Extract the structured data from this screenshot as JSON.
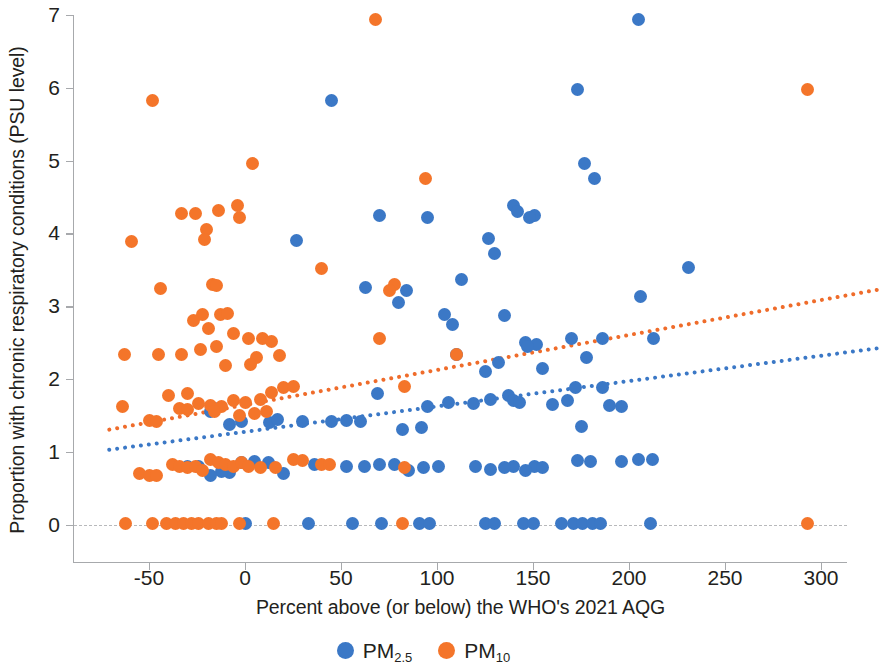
{
  "chart_data": {
    "type": "scatter",
    "title": "",
    "xlabel": "Percent above (or below) the WHO's 2021 AQG",
    "ylabel": "Proportion with chronic respiratory conditions (PSU level)",
    "xlim": [
      -72,
      330
    ],
    "ylim": [
      0,
      7
    ],
    "xticks": [
      -50,
      0,
      50,
      100,
      150,
      200,
      250,
      300
    ],
    "xtick_labels": [
      "-50",
      "0",
      "50",
      "100",
      "150",
      "200",
      "250",
      "300"
    ],
    "yticks": [
      0,
      1,
      2,
      3,
      4,
      5,
      6,
      7
    ],
    "ytick_labels": [
      "0",
      "1",
      "2",
      "3",
      "4",
      "5",
      "6",
      "7"
    ],
    "grid": false,
    "zero_reference_line": 0,
    "legend_position": "bottom",
    "colors": {
      "pm25": "#3b78c6",
      "pm10": "#f4752a",
      "axis": "#a7a9ac",
      "zero_line": "#b8b9bb"
    },
    "series": [
      {
        "name": "PM2.5",
        "label": "PM",
        "subscript": "2.5",
        "color": "#3b78c6",
        "marker": "circle",
        "points": [
          [
            45,
            5.82
          ],
          [
            205,
            6.94
          ],
          [
            173,
            5.98
          ],
          [
            177,
            4.96
          ],
          [
            182,
            4.76
          ],
          [
            140,
            4.38
          ],
          [
            142,
            4.3
          ],
          [
            151,
            4.25
          ],
          [
            148,
            4.22
          ],
          [
            70,
            4.25
          ],
          [
            95,
            4.22
          ],
          [
            27,
            3.9
          ],
          [
            231,
            3.53
          ],
          [
            127,
            3.93
          ],
          [
            130,
            3.72
          ],
          [
            113,
            3.36
          ],
          [
            206,
            3.13
          ],
          [
            63,
            3.26
          ],
          [
            84,
            3.22
          ],
          [
            80,
            3.05
          ],
          [
            104,
            2.88
          ],
          [
            135,
            2.87
          ],
          [
            108,
            2.75
          ],
          [
            170,
            2.55
          ],
          [
            186,
            2.55
          ],
          [
            213,
            2.55
          ],
          [
            146,
            2.5
          ],
          [
            152,
            2.48
          ],
          [
            147,
            2.45
          ],
          [
            110,
            2.34
          ],
          [
            178,
            2.3
          ],
          [
            155,
            2.15
          ],
          [
            132,
            2.22
          ],
          [
            125,
            2.1
          ],
          [
            172,
            1.88
          ],
          [
            186,
            1.88
          ],
          [
            168,
            1.7
          ],
          [
            160,
            1.65
          ],
          [
            137,
            1.78
          ],
          [
            140,
            1.7
          ],
          [
            143,
            1.68
          ],
          [
            128,
            1.72
          ],
          [
            119,
            1.66
          ],
          [
            106,
            1.68
          ],
          [
            95,
            1.62
          ],
          [
            69,
            1.8
          ],
          [
            45,
            1.42
          ],
          [
            53,
            1.43
          ],
          [
            60,
            1.42
          ],
          [
            30,
            1.42
          ],
          [
            82,
            1.3
          ],
          [
            92,
            1.33
          ],
          [
            175,
            1.35
          ],
          [
            190,
            1.63
          ],
          [
            196,
            1.62
          ],
          [
            -16,
            1.6
          ],
          [
            -18,
            1.55
          ],
          [
            -8,
            1.38
          ],
          [
            -2,
            1.42
          ],
          [
            13,
            1.4
          ],
          [
            17,
            1.44
          ],
          [
            173,
            0.88
          ],
          [
            180,
            0.86
          ],
          [
            196,
            0.86
          ],
          [
            205,
            0.9
          ],
          [
            212,
            0.9
          ],
          [
            151,
            0.8
          ],
          [
            155,
            0.78
          ],
          [
            146,
            0.75
          ],
          [
            140,
            0.8
          ],
          [
            135,
            0.78
          ],
          [
            128,
            0.76
          ],
          [
            120,
            0.8
          ],
          [
            101,
            0.8
          ],
          [
            93,
            0.78
          ],
          [
            85,
            0.75
          ],
          [
            78,
            0.82
          ],
          [
            70,
            0.82
          ],
          [
            62,
            0.8
          ],
          [
            53,
            0.8
          ],
          [
            36,
            0.83
          ],
          [
            20,
            0.7
          ],
          [
            12,
            0.85
          ],
          [
            5,
            0.86
          ],
          [
            -2,
            0.85
          ],
          [
            -8,
            0.72
          ],
          [
            -12,
            0.73
          ],
          [
            -18,
            0.68
          ],
          [
            -24,
            0.8
          ],
          [
            -30,
            0.8
          ],
          [
            0,
            0.02
          ],
          [
            33,
            0.02
          ],
          [
            56,
            0.02
          ],
          [
            71,
            0.02
          ],
          [
            91,
            0.02
          ],
          [
            96,
            0.02
          ],
          [
            125,
            0.02
          ],
          [
            130,
            0.02
          ],
          [
            145,
            0.02
          ],
          [
            150,
            0.02
          ],
          [
            165,
            0.02
          ],
          [
            171,
            0.02
          ],
          [
            176,
            0.02
          ],
          [
            181,
            0.02
          ],
          [
            185,
            0.02
          ],
          [
            211,
            0.02
          ]
        ]
      },
      {
        "name": "PM10",
        "label": "PM",
        "subscript": "10",
        "color": "#f4752a",
        "marker": "circle",
        "points": [
          [
            68,
            6.94
          ],
          [
            -48,
            5.82
          ],
          [
            293,
            5.98
          ],
          [
            4,
            4.96
          ],
          [
            94,
            4.75
          ],
          [
            -33,
            4.28
          ],
          [
            -26,
            4.27
          ],
          [
            -14,
            4.31
          ],
          [
            -4,
            4.38
          ],
          [
            -3,
            4.22
          ],
          [
            -59,
            3.89
          ],
          [
            -20,
            4.06
          ],
          [
            -21,
            3.92
          ],
          [
            -44,
            3.25
          ],
          [
            -17,
            3.3
          ],
          [
            -15,
            3.28
          ],
          [
            40,
            3.52
          ],
          [
            78,
            3.3
          ],
          [
            75,
            3.22
          ],
          [
            -22,
            2.88
          ],
          [
            -13,
            2.88
          ],
          [
            -9,
            2.9
          ],
          [
            -27,
            2.8
          ],
          [
            -19,
            2.7
          ],
          [
            -6,
            2.62
          ],
          [
            2,
            2.55
          ],
          [
            9,
            2.55
          ],
          [
            14,
            2.52
          ],
          [
            6,
            2.3
          ],
          [
            18,
            2.32
          ],
          [
            -63,
            2.33
          ],
          [
            -45,
            2.33
          ],
          [
            -33,
            2.33
          ],
          [
            -23,
            2.4
          ],
          [
            -15,
            2.45
          ],
          [
            -10,
            2.18
          ],
          [
            3,
            2.2
          ],
          [
            70,
            2.55
          ],
          [
            110,
            2.33
          ],
          [
            83,
            1.9
          ],
          [
            -40,
            1.78
          ],
          [
            -30,
            1.8
          ],
          [
            -24,
            1.66
          ],
          [
            -18,
            1.63
          ],
          [
            -12,
            1.62
          ],
          [
            -6,
            1.7
          ],
          [
            0,
            1.68
          ],
          [
            8,
            1.72
          ],
          [
            14,
            1.82
          ],
          [
            20,
            1.88
          ],
          [
            25,
            1.9
          ],
          [
            -50,
            1.43
          ],
          [
            -46,
            1.42
          ],
          [
            -64,
            1.62
          ],
          [
            -34,
            1.6
          ],
          [
            -30,
            1.58
          ],
          [
            -16,
            1.55
          ],
          [
            -3,
            1.5
          ],
          [
            5,
            1.52
          ],
          [
            11,
            1.55
          ],
          [
            -55,
            0.7
          ],
          [
            -50,
            0.67
          ],
          [
            -46,
            0.68
          ],
          [
            -38,
            0.82
          ],
          [
            -34,
            0.8
          ],
          [
            -30,
            0.78
          ],
          [
            -26,
            0.8
          ],
          [
            -22,
            0.75
          ],
          [
            -18,
            0.9
          ],
          [
            -14,
            0.85
          ],
          [
            -10,
            0.82
          ],
          [
            -6,
            0.8
          ],
          [
            -2,
            0.85
          ],
          [
            2,
            0.8
          ],
          [
            8,
            0.78
          ],
          [
            16,
            0.78
          ],
          [
            25,
            0.9
          ],
          [
            30,
            0.88
          ],
          [
            40,
            0.83
          ],
          [
            44,
            0.82
          ],
          [
            83,
            0.78
          ],
          [
            -62,
            0.02
          ],
          [
            -48,
            0.02
          ],
          [
            -41,
            0.02
          ],
          [
            -36,
            0.02
          ],
          [
            -32,
            0.02
          ],
          [
            -28,
            0.02
          ],
          [
            -24,
            0.02
          ],
          [
            -19,
            0.02
          ],
          [
            -15,
            0.02
          ],
          [
            -12,
            0.02
          ],
          [
            -3,
            0.02
          ],
          [
            15,
            0.02
          ],
          [
            82,
            0.02
          ],
          [
            293,
            0.02
          ]
        ]
      }
    ],
    "trendlines": [
      {
        "name": "PM2.5 trend",
        "color": "#3b78c6",
        "style": "dotted",
        "x0": -72,
        "y0": 1.05,
        "x1": 330,
        "y1": 2.45
      },
      {
        "name": "PM10 trend",
        "color": "#ef6c2b",
        "style": "dotted",
        "x0": -72,
        "y0": 1.33,
        "x1": 330,
        "y1": 3.26
      }
    ]
  },
  "legend": {
    "items": [
      {
        "label": "PM",
        "subscript": "2.5",
        "color": "#3b78c6",
        "series": "PM2.5"
      },
      {
        "label": "PM",
        "subscript": "10",
        "color": "#f4752a",
        "series": "PM10"
      }
    ]
  }
}
